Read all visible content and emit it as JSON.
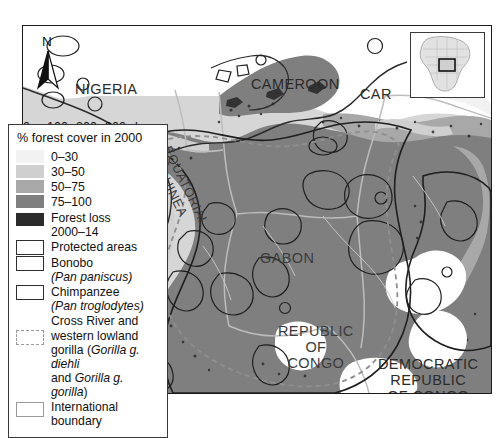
{
  "map": {
    "north_arrow_label": "N",
    "scale_bar": {
      "ticks": [
        "0",
        "100",
        "200",
        "300"
      ],
      "unit": "km",
      "max_km": 300
    },
    "country_labels": [
      {
        "name": "NIGERIA"
      },
      {
        "name": "CAMEROON"
      },
      {
        "name": "CAR"
      },
      {
        "name": "EQUATORIAL\nGUINEA"
      },
      {
        "name": "GABON"
      },
      {
        "name": "REPUBLIC\nOF\nCONGO"
      },
      {
        "name": "DEMOCRATIC\nREPUBLIC\nOF CONGO"
      }
    ],
    "nigeria": "NIGERIA",
    "cameroon": "CAMEROON",
    "car": "CAR",
    "equatorial_guinea": "EQUATORIAL\nGUINEA",
    "gabon": "GABON",
    "republic_of_congo": "REPUBLIC\nOF\nCONGO",
    "drc": "DEMOCRATIC\nREPUBLIC\nOF CONGO"
  },
  "legend": {
    "title": "% forest cover in 2000",
    "entries": [
      {
        "label": "0–30",
        "swatch": "ramp",
        "color": "#f2f2f2"
      },
      {
        "label": "30–50",
        "swatch": "ramp",
        "color": "#cfcfcf"
      },
      {
        "label": "50–75",
        "swatch": "ramp",
        "color": "#a8a8a8"
      },
      {
        "label": "75–100",
        "swatch": "ramp",
        "color": "#7f7f7f"
      },
      {
        "label": "Forest loss\n2000–14",
        "swatch": "ramp",
        "color": "#2b2b2b"
      },
      {
        "label": "Protected areas",
        "swatch": "box",
        "color": "#2e2e2e"
      },
      {
        "label": "Bonobo",
        "label2": "(Pan paniscus)",
        "swatch": "box",
        "color": "#2e2e2e"
      },
      {
        "label": "Chimpanzee",
        "label2": "(Pan troglodytes)",
        "swatch": "box",
        "color": "#2e2e2e"
      },
      {
        "label": "Cross River and western lowland gorilla",
        "label2": "(Gorilla g. diehli and Gorilla g. gorilla)",
        "swatch": "dash",
        "color": "#9a9a9a"
      },
      {
        "label": "International\nboundary",
        "swatch": "box",
        "color": "#9a9a9a"
      }
    ],
    "forest_loss_line1": "Forest loss",
    "forest_loss_line2": "2000–14",
    "protected_areas": "Protected areas",
    "bonobo": "Bonobo",
    "bonobo_sci": "(Pan paniscus)",
    "chimp": "Chimpanzee",
    "chimp_sci": "(Pan troglodytes)",
    "gorilla_l1": "Cross River and",
    "gorilla_l2": "western lowland",
    "gorilla_l3_a": "gorilla (",
    "gorilla_l3_i": "Gorilla g. diehli",
    "gorilla_l4_a": "and ",
    "gorilla_l4_i": "Gorilla g. gorilla",
    "gorilla_l4_b": ")",
    "intl_l1": "International",
    "intl_l2": "boundary",
    "r0": "0–30",
    "r1": "30–50",
    "r2": "50–75",
    "r3": "75–100"
  },
  "inset": {
    "name": "africa-locator",
    "highlight": "study-area-rectangle"
  },
  "colors": {
    "ocean": "#d6d6d6",
    "forest_75_100": "#7f7f7f",
    "forest_50_75": "#a8a8a8",
    "forest_30_50": "#cfcfcf",
    "forest_0_30": "#f2f2f2",
    "forest_loss": "#2b2b2b",
    "boundary": "#9a9a9a",
    "protected": "#2e2e2e",
    "frame": "#1a1a1a"
  }
}
